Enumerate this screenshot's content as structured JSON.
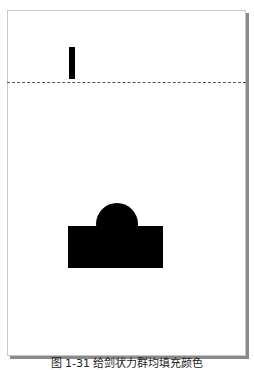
{
  "canvas": {
    "shapes": [
      {
        "name": "vertical-bar",
        "fill": "#000000"
      },
      {
        "name": "rectangle",
        "fill": "#000000"
      },
      {
        "name": "semicircle-dome",
        "fill": "#000000"
      }
    ],
    "guideline": "dashed"
  },
  "caption": {
    "text": "图 1-31 给剑状力群均填充颜色"
  }
}
